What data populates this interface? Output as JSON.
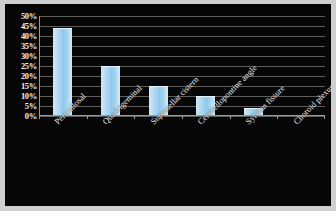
{
  "chart_data": {
    "type": "bar",
    "title": "",
    "xlabel": "",
    "ylabel": "",
    "categories": [
      "Pericallosal",
      "Quadrigeminal",
      "Suprasellar cistern",
      "Cerebellopontine angle",
      "Sylvian fissure",
      "Choroid plexus"
    ],
    "values": [
      44,
      25,
      15,
      10,
      4,
      0
    ],
    "value_labels": [
      "44%",
      "25%",
      "15%",
      "10%",
      "4%",
      "0%"
    ],
    "ylim": [
      0,
      50
    ],
    "ytick_labels": [
      "50%",
      "45%",
      "40%",
      "35%",
      "30%",
      "25%",
      "20%",
      "15%",
      "10%",
      "5%",
      "0%"
    ],
    "ytick_values": [
      50,
      45,
      40,
      35,
      30,
      25,
      20,
      15,
      10,
      5,
      0
    ],
    "grid": true,
    "legend": "none",
    "colors": {
      "background": "#060606",
      "frame": "#cfcfcf",
      "bar_light": "#d8eefb",
      "bar_mid": "#8fc9ea",
      "gridline": "#6d6d6d",
      "axis": "#9a9a9a",
      "text": "#f2f2f2"
    }
  }
}
